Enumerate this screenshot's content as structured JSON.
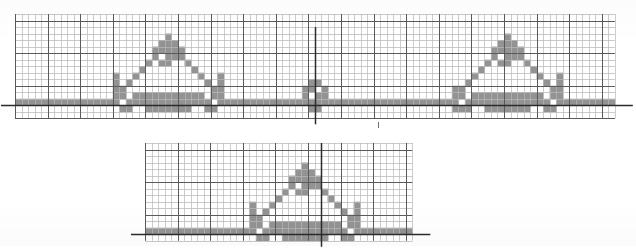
{
  "document": {
    "title": "Graph-paper pixel motif chart",
    "background_color": "#ffffff",
    "width": 636,
    "height": 246
  },
  "style": {
    "grid_minor_color": "#b9b9b9",
    "grid_major_color": "#5a5a5a",
    "axis_color": "#2b2b2b",
    "cell_fill_color": "#8a8a8a",
    "paper_color": "#ffffff",
    "minor_cell_px": 6.5,
    "major_every": 5
  },
  "chart_data": {
    "type": "heatmap",
    "subtitle": "",
    "xlabel": "",
    "ylabel": "",
    "grid": true,
    "legend": false,
    "panels": [
      {
        "name": "upper-panel",
        "x": 15,
        "y": 14,
        "cols": 92,
        "rows": 16,
        "cell": 6.52,
        "major_offset_x": 0,
        "major_offset_y": 1,
        "baseline_row": 13,
        "axis_horizontal": true,
        "axis_vertical_col": 46,
        "axis_vertical_top_row": 2,
        "axis_vertical_bottom_row": 16,
        "filled_cells": [
          [
            0,
            13
          ],
          [
            1,
            13
          ],
          [
            2,
            13
          ],
          [
            3,
            13
          ],
          [
            4,
            13
          ],
          [
            5,
            13
          ],
          [
            6,
            13
          ],
          [
            7,
            13
          ],
          [
            8,
            13
          ],
          [
            9,
            13
          ],
          [
            10,
            13
          ],
          [
            11,
            13
          ],
          [
            12,
            13
          ],
          [
            13,
            13
          ],
          [
            14,
            13
          ],
          [
            15,
            9
          ],
          [
            15,
            10
          ],
          [
            15,
            11
          ],
          [
            15,
            12
          ],
          [
            15,
            13
          ],
          [
            16,
            11
          ],
          [
            16,
            12
          ],
          [
            16,
            14
          ],
          [
            17,
            10
          ],
          [
            17,
            13
          ],
          [
            17,
            14
          ],
          [
            18,
            9
          ],
          [
            18,
            12
          ],
          [
            18,
            13
          ],
          [
            19,
            8
          ],
          [
            19,
            12
          ],
          [
            19,
            13
          ],
          [
            20,
            7
          ],
          [
            20,
            12
          ],
          [
            20,
            13
          ],
          [
            20,
            14
          ],
          [
            21,
            5
          ],
          [
            21,
            6
          ],
          [
            21,
            12
          ],
          [
            21,
            13
          ],
          [
            21,
            14
          ],
          [
            22,
            4
          ],
          [
            22,
            5
          ],
          [
            22,
            7
          ],
          [
            22,
            12
          ],
          [
            22,
            13
          ],
          [
            22,
            14
          ],
          [
            23,
            3
          ],
          [
            23,
            4
          ],
          [
            23,
            5
          ],
          [
            23,
            6
          ],
          [
            23,
            7
          ],
          [
            23,
            12
          ],
          [
            23,
            13
          ],
          [
            23,
            14
          ],
          [
            24,
            4
          ],
          [
            24,
            5
          ],
          [
            24,
            6
          ],
          [
            24,
            12
          ],
          [
            24,
            13
          ],
          [
            24,
            14
          ],
          [
            25,
            5
          ],
          [
            25,
            6
          ],
          [
            25,
            12
          ],
          [
            25,
            13
          ],
          [
            25,
            14
          ],
          [
            26,
            7
          ],
          [
            26,
            12
          ],
          [
            26,
            13
          ],
          [
            26,
            14
          ],
          [
            27,
            8
          ],
          [
            27,
            12
          ],
          [
            27,
            13
          ],
          [
            28,
            9
          ],
          [
            28,
            12
          ],
          [
            28,
            13
          ],
          [
            29,
            10
          ],
          [
            29,
            13
          ],
          [
            29,
            14
          ],
          [
            30,
            11
          ],
          [
            30,
            12
          ],
          [
            30,
            14
          ],
          [
            31,
            9
          ],
          [
            31,
            10
          ],
          [
            31,
            11
          ],
          [
            31,
            12
          ],
          [
            31,
            13
          ],
          [
            32,
            13
          ],
          [
            33,
            13
          ],
          [
            34,
            13
          ],
          [
            35,
            13
          ],
          [
            36,
            13
          ],
          [
            37,
            13
          ],
          [
            38,
            13
          ],
          [
            39,
            13
          ],
          [
            40,
            13
          ],
          [
            41,
            13
          ],
          [
            42,
            13
          ],
          [
            43,
            13
          ],
          [
            44,
            11
          ],
          [
            44,
            12
          ],
          [
            44,
            13
          ],
          [
            45,
            10
          ],
          [
            45,
            11
          ],
          [
            45,
            13
          ],
          [
            45,
            14
          ],
          [
            46,
            10
          ],
          [
            46,
            12
          ],
          [
            46,
            13
          ],
          [
            46,
            14
          ],
          [
            47,
            11
          ],
          [
            47,
            12
          ],
          [
            47,
            13
          ],
          [
            48,
            13
          ],
          [
            49,
            13
          ],
          [
            50,
            13
          ],
          [
            51,
            13
          ],
          [
            52,
            13
          ],
          [
            53,
            13
          ],
          [
            54,
            13
          ],
          [
            55,
            13
          ],
          [
            56,
            13
          ],
          [
            57,
            13
          ],
          [
            58,
            13
          ],
          [
            59,
            13
          ],
          [
            60,
            13
          ],
          [
            61,
            13
          ],
          [
            62,
            13
          ],
          [
            63,
            13
          ],
          [
            64,
            13
          ],
          [
            65,
            13
          ],
          [
            66,
            13
          ],
          [
            67,
            11
          ],
          [
            67,
            12
          ],
          [
            67,
            13
          ],
          [
            67,
            14
          ],
          [
            68,
            11
          ],
          [
            68,
            12
          ],
          [
            68,
            14
          ],
          [
            69,
            10
          ],
          [
            69,
            13
          ],
          [
            69,
            14
          ],
          [
            70,
            9
          ],
          [
            70,
            12
          ],
          [
            70,
            13
          ],
          [
            71,
            8
          ],
          [
            71,
            12
          ],
          [
            71,
            13
          ],
          [
            72,
            7
          ],
          [
            72,
            12
          ],
          [
            72,
            13
          ],
          [
            72,
            14
          ],
          [
            73,
            5
          ],
          [
            73,
            6
          ],
          [
            73,
            12
          ],
          [
            73,
            13
          ],
          [
            73,
            14
          ],
          [
            74,
            4
          ],
          [
            74,
            5
          ],
          [
            74,
            7
          ],
          [
            74,
            12
          ],
          [
            74,
            13
          ],
          [
            74,
            14
          ],
          [
            75,
            3
          ],
          [
            75,
            4
          ],
          [
            75,
            5
          ],
          [
            75,
            6
          ],
          [
            75,
            7
          ],
          [
            75,
            12
          ],
          [
            75,
            13
          ],
          [
            75,
            14
          ],
          [
            76,
            4
          ],
          [
            76,
            5
          ],
          [
            76,
            6
          ],
          [
            76,
            12
          ],
          [
            76,
            13
          ],
          [
            76,
            14
          ],
          [
            77,
            5
          ],
          [
            77,
            6
          ],
          [
            77,
            12
          ],
          [
            77,
            13
          ],
          [
            77,
            14
          ],
          [
            78,
            7
          ],
          [
            78,
            12
          ],
          [
            78,
            13
          ],
          [
            78,
            14
          ],
          [
            79,
            8
          ],
          [
            79,
            12
          ],
          [
            79,
            13
          ],
          [
            80,
            9
          ],
          [
            80,
            12
          ],
          [
            80,
            13
          ],
          [
            81,
            10
          ],
          [
            81,
            13
          ],
          [
            81,
            14
          ],
          [
            82,
            11
          ],
          [
            82,
            12
          ],
          [
            82,
            14
          ],
          [
            83,
            9
          ],
          [
            83,
            10
          ],
          [
            83,
            11
          ],
          [
            83,
            12
          ],
          [
            83,
            13
          ],
          [
            84,
            13
          ],
          [
            85,
            13
          ],
          [
            86,
            13
          ],
          [
            87,
            13
          ],
          [
            88,
            13
          ],
          [
            89,
            13
          ],
          [
            90,
            13
          ],
          [
            91,
            13
          ]
        ]
      },
      {
        "name": "lower-panel",
        "x": 145,
        "y": 143,
        "cols": 41,
        "rows": 15,
        "cell": 6.52,
        "major_offset_x": 0,
        "major_offset_y": 1,
        "baseline_row": 13,
        "axis_horizontal": true,
        "axis_vertical_col": 27,
        "axis_vertical_top_row": 0,
        "axis_vertical_bottom_row": 15,
        "filled_cells": [
          [
            0,
            13
          ],
          [
            1,
            13
          ],
          [
            2,
            13
          ],
          [
            3,
            13
          ],
          [
            4,
            13
          ],
          [
            5,
            13
          ],
          [
            6,
            13
          ],
          [
            7,
            13
          ],
          [
            8,
            13
          ],
          [
            9,
            13
          ],
          [
            10,
            13
          ],
          [
            11,
            13
          ],
          [
            12,
            13
          ],
          [
            13,
            13
          ],
          [
            14,
            13
          ],
          [
            15,
            13
          ],
          [
            16,
            9
          ],
          [
            16,
            10
          ],
          [
            16,
            11
          ],
          [
            16,
            12
          ],
          [
            16,
            13
          ],
          [
            17,
            11
          ],
          [
            17,
            12
          ],
          [
            17,
            14
          ],
          [
            18,
            10
          ],
          [
            18,
            13
          ],
          [
            18,
            14
          ],
          [
            19,
            9
          ],
          [
            19,
            12
          ],
          [
            19,
            13
          ],
          [
            20,
            8
          ],
          [
            20,
            12
          ],
          [
            20,
            13
          ],
          [
            21,
            7
          ],
          [
            21,
            12
          ],
          [
            21,
            13
          ],
          [
            21,
            14
          ],
          [
            22,
            5
          ],
          [
            22,
            6
          ],
          [
            22,
            12
          ],
          [
            22,
            13
          ],
          [
            22,
            14
          ],
          [
            23,
            4
          ],
          [
            23,
            5
          ],
          [
            23,
            7
          ],
          [
            23,
            12
          ],
          [
            23,
            13
          ],
          [
            23,
            14
          ],
          [
            24,
            3
          ],
          [
            24,
            4
          ],
          [
            24,
            5
          ],
          [
            24,
            6
          ],
          [
            24,
            7
          ],
          [
            24,
            12
          ],
          [
            24,
            13
          ],
          [
            24,
            14
          ],
          [
            25,
            4
          ],
          [
            25,
            5
          ],
          [
            25,
            6
          ],
          [
            25,
            12
          ],
          [
            25,
            13
          ],
          [
            25,
            14
          ],
          [
            26,
            5
          ],
          [
            26,
            6
          ],
          [
            26,
            12
          ],
          [
            26,
            13
          ],
          [
            26,
            14
          ],
          [
            27,
            7
          ],
          [
            27,
            12
          ],
          [
            27,
            13
          ],
          [
            27,
            14
          ],
          [
            28,
            8
          ],
          [
            28,
            12
          ],
          [
            28,
            13
          ],
          [
            29,
            9
          ],
          [
            29,
            12
          ],
          [
            29,
            13
          ],
          [
            30,
            10
          ],
          [
            30,
            13
          ],
          [
            30,
            14
          ],
          [
            31,
            11
          ],
          [
            31,
            12
          ],
          [
            31,
            14
          ],
          [
            32,
            9
          ],
          [
            32,
            10
          ],
          [
            32,
            11
          ],
          [
            32,
            12
          ],
          [
            32,
            13
          ],
          [
            33,
            13
          ],
          [
            34,
            13
          ],
          [
            35,
            13
          ],
          [
            36,
            13
          ],
          [
            37,
            13
          ],
          [
            38,
            13
          ],
          [
            39,
            13
          ],
          [
            40,
            13
          ]
        ]
      }
    ],
    "marks": [
      {
        "name": "stray-tick-mark",
        "x": 378,
        "y": 122,
        "width": 1,
        "height": 6
      }
    ]
  }
}
